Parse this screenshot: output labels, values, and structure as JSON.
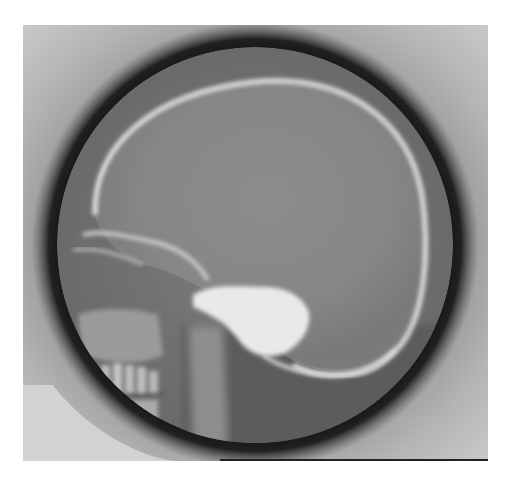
{
  "image": {
    "subject": "lateral skull radiograph",
    "view": "lateral",
    "colors": {
      "background": "#ffffff",
      "film_light": "#c9c9c9",
      "collimator_dark": "#0c0c0c",
      "cranial_vault": "#8a8a8a",
      "bone_bright": "#e6e6e6"
    }
  }
}
